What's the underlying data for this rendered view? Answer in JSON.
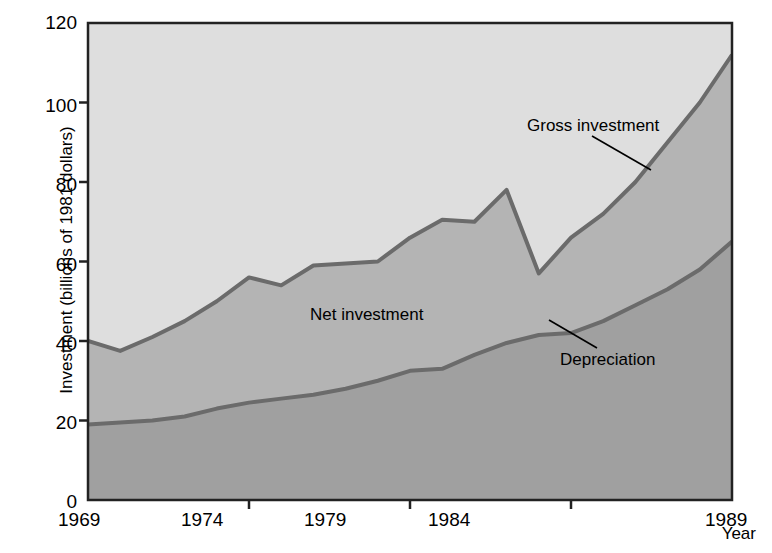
{
  "chart_data": {
    "type": "area",
    "title": "",
    "xlabel": "Year",
    "ylabel": "Investment (billions of 1981 dollars)",
    "xlim": [
      1969,
      1989
    ],
    "ylim": [
      0,
      120
    ],
    "grid": false,
    "legend_position": "inline-annotations",
    "x": [
      1969,
      1970,
      1971,
      1972,
      1973,
      1974,
      1975,
      1976,
      1977,
      1978,
      1979,
      1980,
      1981,
      1982,
      1983,
      1984,
      1985,
      1986,
      1987,
      1988,
      1989
    ],
    "series": [
      {
        "name": "Gross investment",
        "values": [
          40,
          37.5,
          41,
          45,
          50,
          56,
          54,
          59,
          59.5,
          60,
          66,
          70.5,
          70,
          78,
          57,
          66,
          72,
          80,
          90,
          100,
          112
        ]
      },
      {
        "name": "Depreciation",
        "values": [
          19,
          19.5,
          20,
          21,
          23,
          24.5,
          25.5,
          26.5,
          28,
          30,
          32.5,
          33,
          36.5,
          39.5,
          41.5,
          42,
          45,
          49,
          53,
          58,
          65
        ]
      }
    ],
    "band_name": "Net investment",
    "y_ticks": [
      0,
      20,
      40,
      60,
      80,
      100,
      120
    ],
    "x_ticks": [
      1969,
      1974,
      1979,
      1984,
      1989
    ],
    "colors": {
      "plot_background": "#dedede",
      "net_investment_band": "#b4b4b4",
      "depreciation_band": "#a0a0a0",
      "line": "#6b6b6b",
      "frame": "#222222",
      "text": "#000000"
    }
  },
  "annotations": {
    "gross_investment": {
      "label": "Gross investment",
      "leader": "leader-line-gross"
    },
    "net_investment": {
      "label": "Net investment"
    },
    "depreciation": {
      "label": "Depreciation",
      "leader": "leader-line-depreciation"
    }
  },
  "axes": {
    "y_title": "Investment (billions of 1981 dollars)",
    "x_title": "Year",
    "y_tick_labels": [
      "120",
      "100",
      "80",
      "60",
      "40",
      "20",
      "0"
    ],
    "x_tick_labels": [
      "1969",
      "1974",
      "1979",
      "1984",
      "1989"
    ]
  }
}
